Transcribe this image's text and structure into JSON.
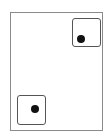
{
  "figure": {
    "outer_frame": {
      "x": 10,
      "y": 12,
      "width": 93,
      "height": 119,
      "border_color": "#8a8a8a"
    },
    "cells": [
      {
        "name": "top-right-cell",
        "x": 72,
        "y": 18,
        "width": 29,
        "height": 29,
        "dot": {
          "cx": 80,
          "cy": 39
        }
      },
      {
        "name": "bottom-left-cell",
        "x": 17,
        "y": 95,
        "width": 29,
        "height": 30,
        "dot": {
          "cx": 34,
          "cy": 108
        }
      }
    ],
    "dot_color": "#111111",
    "cell_border_color": "#555555"
  }
}
